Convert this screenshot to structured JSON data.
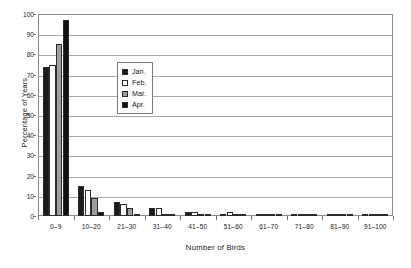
{
  "chart_data": {
    "type": "bar",
    "title": "",
    "xlabel": "Number of Birds",
    "ylabel": "Percentage of Years",
    "ylim": [
      0,
      100
    ],
    "ytick_step": 10,
    "yticks": [
      0,
      10,
      20,
      30,
      40,
      50,
      60,
      70,
      80,
      90,
      100
    ],
    "ytick_labels": [
      "0",
      "10",
      "20",
      "30",
      "40",
      "50",
      "60",
      "70",
      "80",
      "90",
      "100"
    ],
    "grid": true,
    "grid_axis": "y",
    "legend_position": "inside-upper-left",
    "categories": [
      "0–9",
      "10–20",
      "21–30",
      "31–40",
      "41–50",
      "51–60",
      "61–70",
      "71–80",
      "81–90",
      "91–100"
    ],
    "series": [
      {
        "name": "Jan.",
        "color": "#1c1c1c",
        "fill": "solid-black",
        "values": [
          74,
          15,
          7,
          4,
          2,
          1,
          1,
          0,
          0,
          0
        ]
      },
      {
        "name": "Feb.",
        "color": "#ffffff",
        "fill": "white-outline",
        "values": [
          75,
          13,
          6,
          4,
          2,
          2,
          1,
          1,
          1,
          1
        ]
      },
      {
        "name": "Mar.",
        "color": "#9e9e9e",
        "fill": "gray",
        "values": [
          85,
          9,
          4,
          1,
          1,
          0,
          0,
          0,
          0,
          0
        ]
      },
      {
        "name": "Apr.",
        "color": "#101010",
        "fill": "solid-black",
        "values": [
          97,
          2,
          1,
          0,
          0,
          0,
          0,
          0,
          0,
          0
        ]
      }
    ]
  },
  "legend": {
    "entries": [
      {
        "label": "Jan."
      },
      {
        "label": "Feb."
      },
      {
        "label": "Mar."
      },
      {
        "label": "Apr."
      }
    ]
  }
}
